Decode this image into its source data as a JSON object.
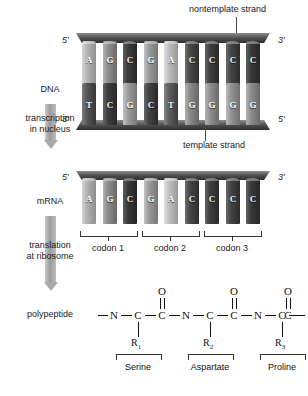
{
  "diagram": {
    "background": "#ffffff"
  },
  "annotations": {
    "nontemplate_strand": "nontemplate strand",
    "template_strand": "template strand"
  },
  "stages": {
    "dna_label": "DNA",
    "mrna_label": "mRNA",
    "polypeptide_label": "polypeptide",
    "transcription_label_line1": "transcription",
    "transcription_label_line2": "in nucleus",
    "translation_label_line1": "translation",
    "translation_label_line2": "at ribosome"
  },
  "dna": {
    "left_top_prime": "5′",
    "left_bottom_prime": "3′",
    "right_top_prime": "3′",
    "right_bottom_prime": "5′",
    "top_strand_bases": [
      "A",
      "G",
      "C",
      "G",
      "A",
      "C",
      "C",
      "C",
      "C"
    ],
    "bottom_strand_bases": [
      "T",
      "C",
      "G",
      "C",
      "T",
      "G",
      "G",
      "G",
      "G"
    ],
    "top_strand_colors": [
      "#b6b6b6",
      "#8f8f8f",
      "#3b3b3b",
      "#9a9a9a",
      "#bdbdbd",
      "#474747",
      "#3f3f3f",
      "#454545",
      "#3a3a3a"
    ],
    "bottom_strand_colors": [
      "#565656",
      "#3e3e3e",
      "#9c9c9c",
      "#414141",
      "#5e5e5e",
      "#8a8a8a",
      "#8f8f8f",
      "#949494",
      "#8d8d8d"
    ]
  },
  "mrna": {
    "left_prime": "5′",
    "right_prime": "3′",
    "bases": [
      "A",
      "G",
      "C",
      "G",
      "A",
      "C",
      "C",
      "C",
      "C"
    ],
    "colors": [
      "#b3b3b3",
      "#8c8c8c",
      "#3a3a3a",
      "#9a9a9a",
      "#c0c0c0",
      "#464646",
      "#3e3e3e",
      "#434343",
      "#3b3b3b"
    ],
    "codon_labels": [
      "codon 1",
      "codon 2",
      "codon 3"
    ]
  },
  "polypeptide": {
    "chain_start": "—",
    "chain_end": "—",
    "residues": [
      {
        "n": "N",
        "ca": "C",
        "co": "C",
        "o": "O",
        "r": "R",
        "r_index": "1",
        "amino_acid": "Serine"
      },
      {
        "n": "N",
        "ca": "C",
        "co": "C",
        "o": "O",
        "r": "R",
        "r_index": "2",
        "amino_acid": "Aspartate"
      },
      {
        "n": "N",
        "ca": "C",
        "co": "C",
        "o": "O",
        "r": "R",
        "r_index": "3",
        "amino_acid": "Proline"
      }
    ]
  }
}
